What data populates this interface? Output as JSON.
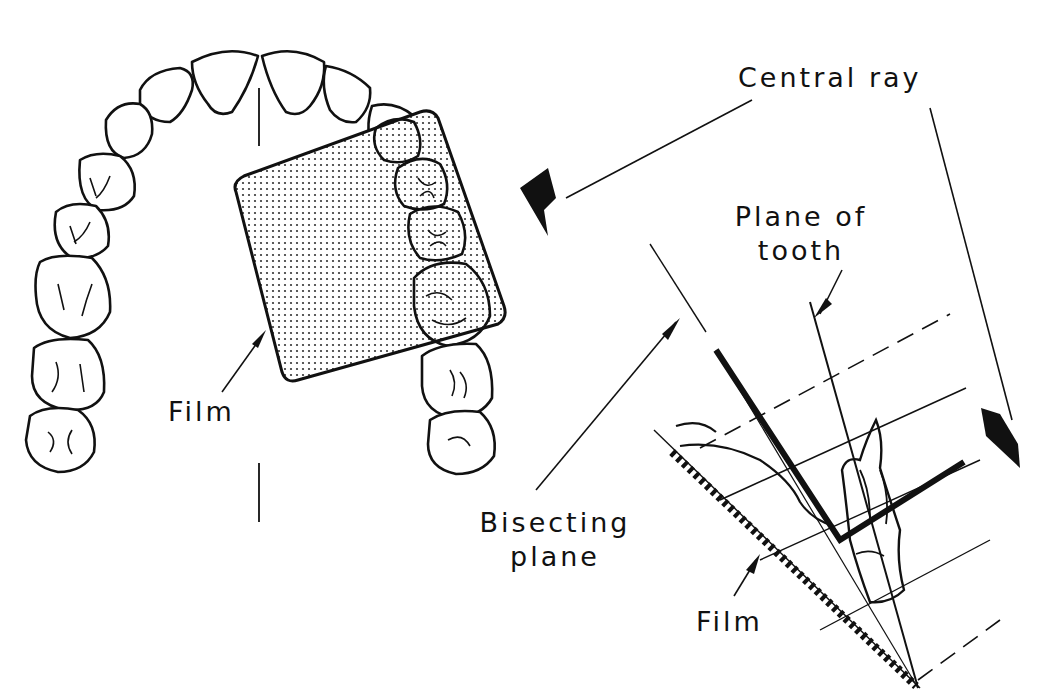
{
  "diagram": {
    "labels": {
      "central_ray": "Central ray",
      "plane_of_tooth_line1": "Plane of",
      "plane_of_tooth_line2": "tooth",
      "film_arch": "Film",
      "bisecting_plane_line1": "Bisecting",
      "bisecting_plane_line2": "plane",
      "film_side": "Film"
    },
    "colors": {
      "ink": "#111111",
      "film_fill": "#e8e8e8",
      "background": "#ffffff"
    },
    "panels": [
      {
        "name": "occlusal-view",
        "description": "Maxillary arch with film placed behind molars"
      },
      {
        "name": "side-view",
        "description": "Tooth, film and bisecting plane with central ray"
      }
    ]
  }
}
